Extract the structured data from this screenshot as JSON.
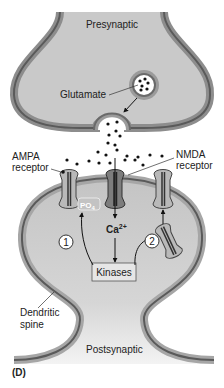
{
  "figure": {
    "panel_label": "(D)",
    "regions": {
      "presynaptic": "Presynaptic",
      "postsynaptic": "Postsynaptic"
    },
    "labels": {
      "glutamate": "Glutamate",
      "ampa_line1": "AMPA",
      "ampa_line2": "receptor",
      "nmda_line1": "NMDA",
      "nmda_line2": "receptor",
      "calcium": "Ca",
      "calcium_sup": "2+",
      "phosphate": "PO",
      "phosphate_sub": "4",
      "kinases": "Kinases",
      "dendritic_line1": "Dendritic",
      "dendritic_line2": "spine"
    },
    "steps": [
      {
        "number": "1"
      },
      {
        "number": "2"
      }
    ],
    "colors": {
      "membrane_outer": "#9a9a9a",
      "membrane_dark": "#5a5a5a",
      "cytoplasm": "#c8c8c8",
      "receptor_ampa": "#b9b9b9",
      "receptor_nmda": "#7d7d7d"
    }
  }
}
